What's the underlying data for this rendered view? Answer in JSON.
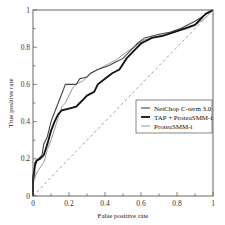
{
  "chart_data": {
    "type": "line",
    "title": "",
    "xlabel": "False positive rate",
    "ylabel": "True positive rate",
    "xlim": [
      0,
      1
    ],
    "ylim": [
      0,
      1
    ],
    "x_ticks": [
      "0",
      "0.2",
      "0.4",
      "0.6",
      "0.8",
      "1"
    ],
    "y_ticks": [
      "0",
      "0.2",
      "0.4",
      "0.6",
      "0.8",
      "1"
    ],
    "grid": false,
    "legend_position": "lower right",
    "reference_line": {
      "label": "random",
      "style": "dashed",
      "color": "#9a9a9a",
      "points": [
        [
          0,
          0
        ],
        [
          1,
          1
        ]
      ]
    },
    "series": [
      {
        "name": "NetChop C-term 3.0",
        "color": "#444444",
        "width": 1.1,
        "points": [
          [
            0,
            0
          ],
          [
            0,
            0.08
          ],
          [
            0.01,
            0.12
          ],
          [
            0.01,
            0.18
          ],
          [
            0.03,
            0.2
          ],
          [
            0.05,
            0.22
          ],
          [
            0.06,
            0.28
          ],
          [
            0.08,
            0.32
          ],
          [
            0.1,
            0.4
          ],
          [
            0.12,
            0.45
          ],
          [
            0.14,
            0.5
          ],
          [
            0.16,
            0.55
          ],
          [
            0.18,
            0.6
          ],
          [
            0.24,
            0.6
          ],
          [
            0.26,
            0.63
          ],
          [
            0.3,
            0.64
          ],
          [
            0.32,
            0.66
          ],
          [
            0.36,
            0.68
          ],
          [
            0.42,
            0.7
          ],
          [
            0.46,
            0.72
          ],
          [
            0.5,
            0.74
          ],
          [
            0.54,
            0.78
          ],
          [
            0.58,
            0.82
          ],
          [
            0.62,
            0.85
          ],
          [
            0.7,
            0.87
          ],
          [
            0.76,
            0.88
          ],
          [
            0.82,
            0.9
          ],
          [
            0.9,
            0.94
          ],
          [
            0.95,
            0.97
          ],
          [
            1,
            1
          ]
        ]
      },
      {
        "name": "TAP + ProteaSMM-i",
        "color": "#111111",
        "width": 1.8,
        "points": [
          [
            0,
            0
          ],
          [
            0,
            0.1
          ],
          [
            0.01,
            0.16
          ],
          [
            0.02,
            0.19
          ],
          [
            0.04,
            0.2
          ],
          [
            0.06,
            0.22
          ],
          [
            0.07,
            0.25
          ],
          [
            0.08,
            0.28
          ],
          [
            0.1,
            0.35
          ],
          [
            0.12,
            0.4
          ],
          [
            0.14,
            0.44
          ],
          [
            0.16,
            0.46
          ],
          [
            0.2,
            0.47
          ],
          [
            0.24,
            0.48
          ],
          [
            0.26,
            0.5
          ],
          [
            0.28,
            0.52
          ],
          [
            0.3,
            0.54
          ],
          [
            0.34,
            0.56
          ],
          [
            0.36,
            0.6
          ],
          [
            0.4,
            0.63
          ],
          [
            0.44,
            0.66
          ],
          [
            0.48,
            0.68
          ],
          [
            0.52,
            0.74
          ],
          [
            0.56,
            0.78
          ],
          [
            0.6,
            0.82
          ],
          [
            0.66,
            0.85
          ],
          [
            0.72,
            0.86
          ],
          [
            0.78,
            0.88
          ],
          [
            0.84,
            0.9
          ],
          [
            0.9,
            0.92
          ],
          [
            0.96,
            0.98
          ],
          [
            1,
            1
          ]
        ]
      },
      {
        "name": "ProteaSMM-i",
        "color": "#999999",
        "width": 1.0,
        "points": [
          [
            0,
            0
          ],
          [
            0,
            0.06
          ],
          [
            0.01,
            0.1
          ],
          [
            0.03,
            0.14
          ],
          [
            0.06,
            0.18
          ],
          [
            0.08,
            0.25
          ],
          [
            0.1,
            0.3
          ],
          [
            0.12,
            0.36
          ],
          [
            0.14,
            0.42
          ],
          [
            0.16,
            0.48
          ],
          [
            0.18,
            0.5
          ],
          [
            0.2,
            0.54
          ],
          [
            0.22,
            0.58
          ],
          [
            0.24,
            0.6
          ],
          [
            0.28,
            0.62
          ],
          [
            0.32,
            0.66
          ],
          [
            0.36,
            0.68
          ],
          [
            0.42,
            0.71
          ],
          [
            0.46,
            0.73
          ],
          [
            0.5,
            0.76
          ],
          [
            0.56,
            0.8
          ],
          [
            0.62,
            0.84
          ],
          [
            0.7,
            0.86
          ],
          [
            0.78,
            0.88
          ],
          [
            0.86,
            0.9
          ],
          [
            0.92,
            0.93
          ],
          [
            0.96,
            0.96
          ],
          [
            1,
            1
          ]
        ]
      }
    ]
  }
}
